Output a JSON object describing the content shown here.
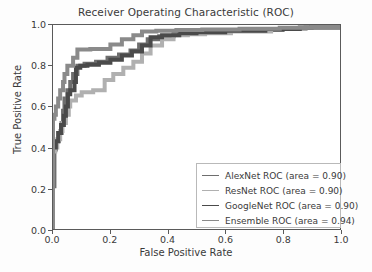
{
  "chart_data": {
    "type": "line",
    "title": "Receiver Operating Characteristic (ROC)",
    "xlabel": "False Positive Rate",
    "ylabel": "True Positive Rate",
    "xlim": [
      0.0,
      1.0
    ],
    "ylim": [
      0.0,
      1.0
    ],
    "xticks": [
      "0.0",
      "0.2",
      "0.4",
      "0.6",
      "0.8",
      "1.0"
    ],
    "yticks": [
      "0.0",
      "0.2",
      "0.4",
      "0.6",
      "0.8",
      "1.0"
    ],
    "xtick_values": [
      0.0,
      0.2,
      0.4,
      0.6,
      0.8,
      1.0
    ],
    "ytick_values": [
      0.0,
      0.2,
      0.4,
      0.6,
      0.8,
      1.0
    ],
    "grid": false,
    "legend_position": "lower right",
    "series": [
      {
        "name": "AlexNet ROC (area = 0.90)",
        "label": "AlexNet ROC (area = 0.90)",
        "area": 0.9,
        "color": "#6e6e6e",
        "points": [
          [
            0.0,
            0.0
          ],
          [
            0.0,
            0.21
          ],
          [
            0.005,
            0.21
          ],
          [
            0.005,
            0.39
          ],
          [
            0.01,
            0.39
          ],
          [
            0.01,
            0.43
          ],
          [
            0.02,
            0.43
          ],
          [
            0.02,
            0.47
          ],
          [
            0.03,
            0.47
          ],
          [
            0.03,
            0.52
          ],
          [
            0.035,
            0.52
          ],
          [
            0.035,
            0.58
          ],
          [
            0.04,
            0.58
          ],
          [
            0.04,
            0.64
          ],
          [
            0.05,
            0.64
          ],
          [
            0.05,
            0.68
          ],
          [
            0.06,
            0.68
          ],
          [
            0.06,
            0.72
          ],
          [
            0.07,
            0.72
          ],
          [
            0.07,
            0.76
          ],
          [
            0.085,
            0.76
          ],
          [
            0.085,
            0.8
          ],
          [
            0.11,
            0.8
          ],
          [
            0.11,
            0.81
          ],
          [
            0.15,
            0.81
          ],
          [
            0.15,
            0.82
          ],
          [
            0.19,
            0.82
          ],
          [
            0.19,
            0.84
          ],
          [
            0.23,
            0.84
          ],
          [
            0.23,
            0.855
          ],
          [
            0.27,
            0.855
          ],
          [
            0.27,
            0.875
          ],
          [
            0.3,
            0.875
          ],
          [
            0.3,
            0.905
          ],
          [
            0.33,
            0.905
          ],
          [
            0.33,
            0.93
          ],
          [
            0.37,
            0.93
          ],
          [
            0.37,
            0.945
          ],
          [
            0.42,
            0.945
          ],
          [
            0.42,
            0.96
          ],
          [
            0.47,
            0.96
          ],
          [
            0.47,
            0.965
          ],
          [
            0.56,
            0.965
          ],
          [
            0.56,
            0.97
          ],
          [
            0.68,
            0.97
          ],
          [
            0.68,
            0.975
          ],
          [
            0.8,
            0.975
          ],
          [
            0.8,
            0.985
          ],
          [
            0.9,
            0.985
          ],
          [
            0.9,
            0.99
          ],
          [
            1.0,
            0.99
          ]
        ]
      },
      {
        "name": "ResNet ROC (area = 0.90)",
        "label": "ResNet ROC (area = 0.90)",
        "area": 0.9,
        "color": "#b0b0b0",
        "points": [
          [
            0.0,
            0.0
          ],
          [
            0.0,
            0.38
          ],
          [
            0.008,
            0.38
          ],
          [
            0.008,
            0.4
          ],
          [
            0.015,
            0.4
          ],
          [
            0.015,
            0.44
          ],
          [
            0.025,
            0.44
          ],
          [
            0.025,
            0.48
          ],
          [
            0.033,
            0.48
          ],
          [
            0.033,
            0.52
          ],
          [
            0.045,
            0.52
          ],
          [
            0.045,
            0.56
          ],
          [
            0.055,
            0.56
          ],
          [
            0.055,
            0.6
          ],
          [
            0.06,
            0.6
          ],
          [
            0.06,
            0.63
          ],
          [
            0.08,
            0.63
          ],
          [
            0.08,
            0.655
          ],
          [
            0.1,
            0.655
          ],
          [
            0.1,
            0.67
          ],
          [
            0.14,
            0.67
          ],
          [
            0.14,
            0.68
          ],
          [
            0.18,
            0.68
          ],
          [
            0.18,
            0.73
          ],
          [
            0.21,
            0.73
          ],
          [
            0.21,
            0.76
          ],
          [
            0.245,
            0.76
          ],
          [
            0.245,
            0.79
          ],
          [
            0.28,
            0.79
          ],
          [
            0.28,
            0.82
          ],
          [
            0.31,
            0.82
          ],
          [
            0.31,
            0.86
          ],
          [
            0.34,
            0.86
          ],
          [
            0.34,
            0.9
          ],
          [
            0.38,
            0.9
          ],
          [
            0.38,
            0.93
          ],
          [
            0.42,
            0.93
          ],
          [
            0.42,
            0.95
          ],
          [
            0.47,
            0.95
          ],
          [
            0.47,
            0.955
          ],
          [
            0.53,
            0.955
          ],
          [
            0.53,
            0.96
          ],
          [
            0.62,
            0.96
          ],
          [
            0.62,
            0.968
          ],
          [
            0.76,
            0.968
          ],
          [
            0.76,
            0.98
          ],
          [
            0.88,
            0.98
          ],
          [
            0.88,
            0.988
          ],
          [
            1.0,
            0.988
          ]
        ]
      },
      {
        "name": "GoogleNet ROC (area = 0.90)",
        "label": "GoogleNet ROC (area = 0.90)",
        "area": 0.9,
        "color": "#4a4a4a",
        "points": [
          [
            0.0,
            0.0
          ],
          [
            0.0,
            0.4
          ],
          [
            0.01,
            0.4
          ],
          [
            0.01,
            0.43
          ],
          [
            0.018,
            0.43
          ],
          [
            0.018,
            0.47
          ],
          [
            0.028,
            0.47
          ],
          [
            0.028,
            0.51
          ],
          [
            0.038,
            0.51
          ],
          [
            0.038,
            0.555
          ],
          [
            0.045,
            0.555
          ],
          [
            0.045,
            0.6
          ],
          [
            0.052,
            0.6
          ],
          [
            0.052,
            0.66
          ],
          [
            0.06,
            0.66
          ],
          [
            0.06,
            0.68
          ],
          [
            0.075,
            0.68
          ],
          [
            0.075,
            0.72
          ],
          [
            0.08,
            0.72
          ],
          [
            0.08,
            0.79
          ],
          [
            0.095,
            0.79
          ],
          [
            0.095,
            0.8
          ],
          [
            0.12,
            0.8
          ],
          [
            0.12,
            0.805
          ],
          [
            0.16,
            0.805
          ],
          [
            0.16,
            0.815
          ],
          [
            0.2,
            0.815
          ],
          [
            0.2,
            0.83
          ],
          [
            0.24,
            0.83
          ],
          [
            0.24,
            0.85
          ],
          [
            0.275,
            0.85
          ],
          [
            0.275,
            0.87
          ],
          [
            0.31,
            0.87
          ],
          [
            0.31,
            0.9
          ],
          [
            0.34,
            0.9
          ],
          [
            0.34,
            0.94
          ],
          [
            0.38,
            0.94
          ],
          [
            0.38,
            0.95
          ],
          [
            0.44,
            0.95
          ],
          [
            0.44,
            0.96
          ],
          [
            0.5,
            0.96
          ],
          [
            0.5,
            0.965
          ],
          [
            0.6,
            0.965
          ],
          [
            0.6,
            0.972
          ],
          [
            0.74,
            0.972
          ],
          [
            0.74,
            0.98
          ],
          [
            0.86,
            0.98
          ],
          [
            0.86,
            0.988
          ],
          [
            1.0,
            0.988
          ]
        ]
      },
      {
        "name": "Ensemble ROC (area = 0.94)",
        "label": "Ensemble ROC (area = 0.94)",
        "area": 0.94,
        "color": "#8a8a8a",
        "points": [
          [
            0.0,
            0.0
          ],
          [
            0.0,
            0.54
          ],
          [
            0.005,
            0.54
          ],
          [
            0.005,
            0.56
          ],
          [
            0.01,
            0.56
          ],
          [
            0.01,
            0.6
          ],
          [
            0.018,
            0.6
          ],
          [
            0.018,
            0.64
          ],
          [
            0.025,
            0.64
          ],
          [
            0.025,
            0.68
          ],
          [
            0.035,
            0.68
          ],
          [
            0.035,
            0.72
          ],
          [
            0.04,
            0.72
          ],
          [
            0.04,
            0.76
          ],
          [
            0.05,
            0.76
          ],
          [
            0.05,
            0.8
          ],
          [
            0.07,
            0.8
          ],
          [
            0.07,
            0.84
          ],
          [
            0.085,
            0.84
          ],
          [
            0.085,
            0.88
          ],
          [
            0.13,
            0.88
          ],
          [
            0.13,
            0.882
          ],
          [
            0.2,
            0.882
          ],
          [
            0.2,
            0.905
          ],
          [
            0.24,
            0.905
          ],
          [
            0.24,
            0.93
          ],
          [
            0.28,
            0.93
          ],
          [
            0.28,
            0.95
          ],
          [
            0.31,
            0.95
          ],
          [
            0.31,
            0.968
          ],
          [
            0.36,
            0.968
          ],
          [
            0.36,
            0.972
          ],
          [
            0.43,
            0.972
          ],
          [
            0.43,
            0.975
          ],
          [
            0.52,
            0.975
          ],
          [
            0.52,
            0.978
          ],
          [
            0.65,
            0.978
          ],
          [
            0.65,
            0.982
          ],
          [
            0.79,
            0.982
          ],
          [
            0.79,
            0.986
          ],
          [
            0.9,
            0.986
          ],
          [
            0.9,
            0.99
          ],
          [
            1.0,
            0.99
          ]
        ]
      }
    ]
  }
}
